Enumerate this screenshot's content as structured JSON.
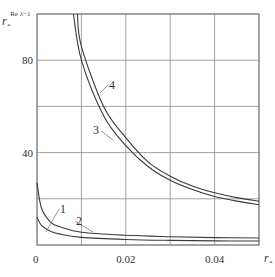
{
  "chart_data": {
    "type": "line",
    "title": "",
    "xlabel": "r*",
    "ylabel": "r*^(Re λ−1)",
    "ylabel_parts": {
      "base": "r",
      "sub": "*",
      "sup": "Re λ−1"
    },
    "xlabel_parts": {
      "base": "r",
      "sub": "*"
    },
    "xlim": [
      0,
      0.05
    ],
    "ylim": [
      0,
      100
    ],
    "grid": true,
    "x_ticks": [
      0,
      0.01,
      0.02,
      0.03,
      0.04,
      0.05
    ],
    "x_tick_labels": [
      {
        "value": 0,
        "text": "0"
      },
      {
        "value": 0.02,
        "text": "0.02"
      },
      {
        "value": 0.04,
        "text": "0.04"
      }
    ],
    "y_ticks": [
      0,
      20,
      40,
      60,
      80,
      100
    ],
    "y_tick_labels": [
      {
        "value": 40,
        "text": "40"
      },
      {
        "value": 80,
        "text": "80"
      }
    ],
    "legend": "inline curve labels 1–4",
    "series": [
      {
        "name": "1",
        "x": [
          0,
          0.001,
          0.003,
          0.005,
          0.01,
          0.02,
          0.03,
          0.04,
          0.05
        ],
        "values": [
          12,
          8.5,
          6,
          4.8,
          3.3,
          2.4,
          2.0,
          1.8,
          1.7
        ]
      },
      {
        "name": "2",
        "x": [
          0,
          0.001,
          0.003,
          0.005,
          0.01,
          0.02,
          0.03,
          0.04,
          0.05
        ],
        "values": [
          27,
          16,
          10,
          8,
          5.5,
          4.2,
          3.6,
          3.2,
          3.0
        ]
      },
      {
        "name": "3",
        "x": [
          0.0082,
          0.01,
          0.015,
          0.02,
          0.025,
          0.03,
          0.035,
          0.04,
          0.045,
          0.05
        ],
        "values": [
          100,
          80,
          56,
          43,
          34,
          28,
          24,
          21,
          19,
          17.5
        ]
      },
      {
        "name": "4",
        "x": [
          0.0091,
          0.01,
          0.015,
          0.02,
          0.025,
          0.03,
          0.035,
          0.04,
          0.045,
          0.05
        ],
        "values": [
          100,
          86,
          60,
          46.5,
          36,
          29.8,
          25.5,
          22.6,
          20.5,
          19
        ]
      }
    ],
    "annotations": [
      {
        "text": "1",
        "x": 0.006,
        "y": 14
      },
      {
        "text": "2",
        "x": 0.0145,
        "y": 10
      },
      {
        "text": "3",
        "x": 0.0135,
        "y": 49.5
      },
      {
        "text": "4",
        "x": 0.0165,
        "y": 69.5
      }
    ]
  },
  "colors": {
    "curve": "#3a3a3a",
    "grid": "#8a8a8a",
    "axis": "#555555",
    "text": "#333333"
  }
}
